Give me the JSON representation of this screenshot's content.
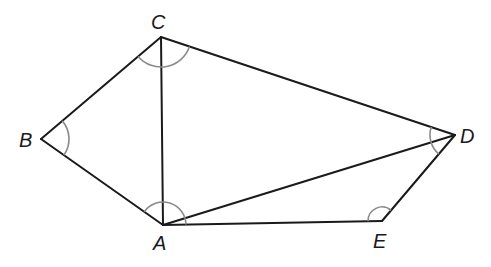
{
  "diagram": {
    "type": "geometry-pentagon-triangulated",
    "vertices": {
      "A": {
        "label": "A",
        "x": 163,
        "y": 225,
        "label_x": 153,
        "label_y": 250
      },
      "B": {
        "label": "B",
        "x": 41,
        "y": 139,
        "label_x": 19,
        "label_y": 147
      },
      "C": {
        "label": "C",
        "x": 161,
        "y": 37,
        "label_x": 151,
        "label_y": 29
      },
      "D": {
        "label": "D",
        "x": 455,
        "y": 135,
        "label_x": 460,
        "label_y": 143
      },
      "E": {
        "label": "E",
        "x": 382,
        "y": 221,
        "label_x": 373,
        "label_y": 248
      }
    },
    "edges": [
      {
        "from": "A",
        "to": "B",
        "type": "side"
      },
      {
        "from": "B",
        "to": "C",
        "type": "side"
      },
      {
        "from": "C",
        "to": "D",
        "type": "side"
      },
      {
        "from": "D",
        "to": "E",
        "type": "side"
      },
      {
        "from": "E",
        "to": "A",
        "type": "side"
      },
      {
        "from": "A",
        "to": "C",
        "type": "diagonal"
      },
      {
        "from": "A",
        "to": "D",
        "type": "diagonal"
      }
    ],
    "angle_marks": [
      {
        "vertex": "A",
        "radius": 23
      },
      {
        "vertex": "B",
        "radius": 28
      },
      {
        "vertex": "C",
        "radius": 30
      },
      {
        "vertex": "D",
        "radius": 25
      },
      {
        "vertex": "E",
        "radius": 14
      }
    ],
    "colors": {
      "line": "#1a1a1a",
      "arc": "#8a8a8a",
      "background": "#ffffff"
    }
  }
}
